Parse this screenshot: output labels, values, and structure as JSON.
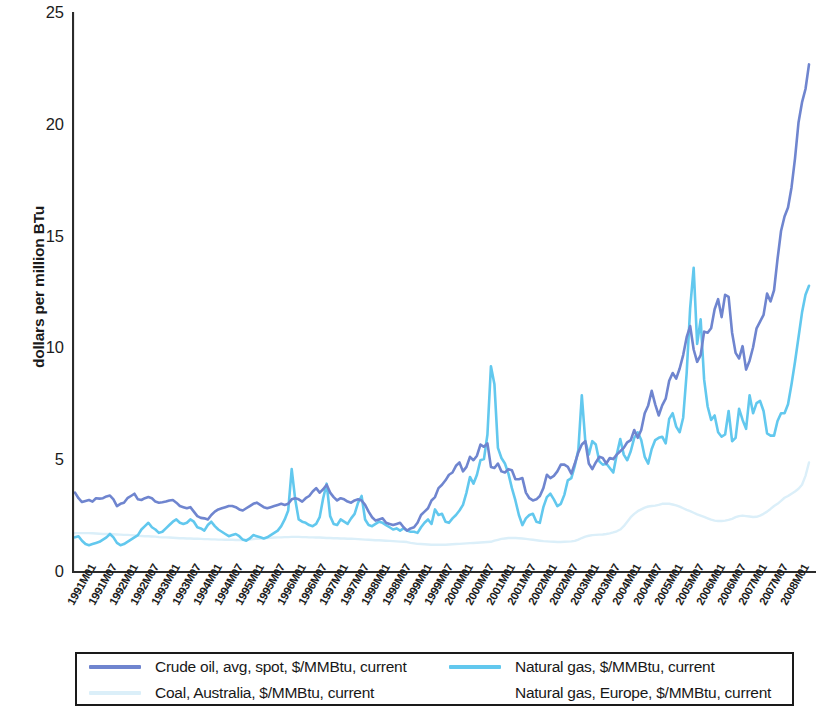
{
  "chart_data": {
    "type": "line",
    "title": "",
    "xlabel": "",
    "ylabel": "dollars per million BTu",
    "ylim": [
      0,
      25
    ],
    "yticks": [
      0,
      5,
      10,
      15,
      20,
      25
    ],
    "grid": false,
    "legend_position": "bottom",
    "x_start": "1991M01",
    "x_end": "2008M01",
    "x_tick_labels": [
      "1991M01",
      "1991M07",
      "1992M01",
      "1992M07",
      "1993M01",
      "1993M07",
      "1994M01",
      "1994M07",
      "1995M01",
      "1995M07",
      "1996M01",
      "1996M07",
      "1997M01",
      "1997M07",
      "1998M01",
      "1998M07",
      "1999M01",
      "1999M07",
      "2000M01",
      "2000M07",
      "2001M01",
      "2001M07",
      "2002M01",
      "2002M07",
      "2003M01",
      "2003M07",
      "2004M01",
      "2004M07",
      "2005M01",
      "2005M07",
      "2006M01",
      "2006M07",
      "2007M01",
      "2007M07",
      "2008M01"
    ],
    "colors": {
      "crude_oil": "#6f85cf",
      "natural_gas": "#62c8ee",
      "coal_australia": "#dbeff9",
      "natural_gas_europe": "#ffffff"
    },
    "series": [
      {
        "name": "Crude oil, avg, spot, $/MMBtu, current",
        "color": "#6f85cf",
        "values": [
          3.55,
          3.3,
          3.13,
          3.18,
          3.22,
          3.15,
          3.3,
          3.28,
          3.3,
          3.38,
          3.42,
          3.25,
          2.95,
          3.05,
          3.1,
          3.3,
          3.4,
          3.5,
          3.25,
          3.22,
          3.3,
          3.35,
          3.3,
          3.15,
          3.1,
          3.12,
          3.15,
          3.2,
          3.22,
          3.1,
          2.95,
          2.9,
          2.85,
          2.9,
          2.7,
          2.5,
          2.42,
          2.4,
          2.35,
          2.55,
          2.7,
          2.8,
          2.85,
          2.9,
          2.95,
          2.95,
          2.9,
          2.8,
          2.75,
          2.85,
          2.95,
          3.05,
          3.1,
          3.0,
          2.9,
          2.85,
          2.9,
          2.95,
          3.0,
          3.05,
          3.0,
          3.05,
          3.25,
          3.3,
          3.25,
          3.15,
          3.3,
          3.4,
          3.6,
          3.75,
          3.55,
          3.7,
          3.9,
          3.55,
          3.35,
          3.2,
          3.3,
          3.25,
          3.15,
          3.1,
          3.2,
          3.25,
          3.2,
          3.0,
          2.7,
          2.45,
          2.3,
          2.35,
          2.4,
          2.2,
          2.15,
          2.1,
          2.15,
          2.2,
          2.0,
          1.85,
          1.95,
          2.0,
          2.2,
          2.55,
          2.7,
          2.85,
          3.2,
          3.35,
          3.75,
          3.9,
          4.1,
          4.35,
          4.45,
          4.75,
          4.9,
          4.5,
          4.7,
          5.15,
          5.0,
          5.2,
          5.7,
          5.6,
          5.75,
          4.7,
          4.65,
          4.85,
          4.5,
          4.45,
          4.6,
          4.55,
          4.15,
          4.15,
          4.2,
          3.55,
          3.3,
          3.2,
          3.25,
          3.4,
          3.75,
          4.35,
          4.2,
          4.3,
          4.5,
          4.8,
          4.8,
          4.7,
          4.4,
          4.85,
          5.35,
          5.7,
          5.85,
          4.85,
          4.6,
          4.9,
          5.15,
          5.1,
          4.85,
          5.1,
          5.05,
          5.25,
          5.4,
          5.55,
          5.8,
          5.9,
          6.35,
          6.0,
          6.35,
          7.1,
          7.45,
          8.1,
          7.5,
          7.0,
          7.45,
          7.75,
          8.55,
          8.9,
          8.65,
          9.1,
          9.7,
          10.5,
          11.0,
          9.95,
          9.4,
          9.7,
          10.75,
          10.7,
          10.9,
          11.75,
          12.2,
          11.4,
          12.4,
          12.3,
          10.7,
          9.8,
          9.55,
          10.1,
          9.05,
          9.45,
          10.05,
          10.9,
          11.2,
          11.5,
          12.45,
          12.1,
          12.6,
          14.0,
          15.25,
          15.9,
          16.3,
          17.2,
          18.5,
          20.1,
          21.0,
          21.6,
          22.7
        ]
      },
      {
        "name": "Natural gas, $/MMBtu, current",
        "color": "#62c8ee",
        "values": [
          1.55,
          1.6,
          1.4,
          1.25,
          1.2,
          1.25,
          1.3,
          1.35,
          1.45,
          1.55,
          1.7,
          1.55,
          1.3,
          1.2,
          1.25,
          1.35,
          1.45,
          1.55,
          1.65,
          1.9,
          2.05,
          2.2,
          2.0,
          1.9,
          1.75,
          1.8,
          1.95,
          2.1,
          2.25,
          2.35,
          2.2,
          2.15,
          2.2,
          2.35,
          2.25,
          2.0,
          1.95,
          1.85,
          2.1,
          2.25,
          2.05,
          1.9,
          1.8,
          1.7,
          1.6,
          1.65,
          1.7,
          1.6,
          1.45,
          1.4,
          1.5,
          1.65,
          1.6,
          1.55,
          1.5,
          1.55,
          1.65,
          1.75,
          1.85,
          2.05,
          2.35,
          2.75,
          4.6,
          3.25,
          2.35,
          2.25,
          2.2,
          2.1,
          2.05,
          2.15,
          2.45,
          3.3,
          3.95,
          2.5,
          2.15,
          2.1,
          2.35,
          2.25,
          2.15,
          2.4,
          2.6,
          3.1,
          3.4,
          2.35,
          2.1,
          2.05,
          2.15,
          2.25,
          2.2,
          2.1,
          2.0,
          1.9,
          1.95,
          1.85,
          1.95,
          1.85,
          1.8,
          1.8,
          1.75,
          2.0,
          2.2,
          2.35,
          2.15,
          2.8,
          2.55,
          2.6,
          2.25,
          2.2,
          2.4,
          2.55,
          2.75,
          3.0,
          3.55,
          4.25,
          3.95,
          4.35,
          5.0,
          5.05,
          6.15,
          9.2,
          8.4,
          5.55,
          5.1,
          4.85,
          4.4,
          3.75,
          3.2,
          2.55,
          2.1,
          2.4,
          2.55,
          2.6,
          2.25,
          2.2,
          2.9,
          3.35,
          3.5,
          3.25,
          2.95,
          3.05,
          3.45,
          4.1,
          4.2,
          4.75,
          5.45,
          7.9,
          5.85,
          5.25,
          5.85,
          5.7,
          4.95,
          4.8,
          4.85,
          4.65,
          4.45,
          5.25,
          5.95,
          5.25,
          5.0,
          5.4,
          6.0,
          6.25,
          5.9,
          5.15,
          4.85,
          5.5,
          5.9,
          6.0,
          6.05,
          5.75,
          6.85,
          7.1,
          6.5,
          6.25,
          6.9,
          8.9,
          11.8,
          13.6,
          10.2,
          11.3,
          8.6,
          7.4,
          6.8,
          7.0,
          6.25,
          6.05,
          6.15,
          7.2,
          5.85,
          6.0,
          7.3,
          6.8,
          6.4,
          7.9,
          7.1,
          7.55,
          7.65,
          7.2,
          6.2,
          6.1,
          6.1,
          6.75,
          7.1,
          7.1,
          7.5,
          8.4,
          9.4,
          10.5,
          11.6,
          12.4,
          12.8
        ]
      },
      {
        "name": "Coal, Australia, $/MMBtu, current",
        "color": "#dbeff9",
        "values": [
          1.74,
          1.74,
          1.74,
          1.74,
          1.74,
          1.73,
          1.72,
          1.71,
          1.7,
          1.7,
          1.7,
          1.69,
          1.68,
          1.67,
          1.66,
          1.66,
          1.65,
          1.64,
          1.62,
          1.61,
          1.6,
          1.6,
          1.59,
          1.58,
          1.56,
          1.55,
          1.55,
          1.54,
          1.53,
          1.52,
          1.51,
          1.51,
          1.5,
          1.5,
          1.49,
          1.49,
          1.48,
          1.47,
          1.47,
          1.46,
          1.46,
          1.45,
          1.45,
          1.44,
          1.44,
          1.44,
          1.43,
          1.43,
          1.43,
          1.44,
          1.45,
          1.47,
          1.49,
          1.5,
          1.51,
          1.52,
          1.53,
          1.54,
          1.55,
          1.55,
          1.56,
          1.56,
          1.57,
          1.57,
          1.57,
          1.56,
          1.56,
          1.55,
          1.55,
          1.54,
          1.54,
          1.53,
          1.52,
          1.52,
          1.51,
          1.51,
          1.5,
          1.5,
          1.49,
          1.49,
          1.48,
          1.47,
          1.46,
          1.45,
          1.44,
          1.43,
          1.42,
          1.42,
          1.41,
          1.4,
          1.39,
          1.38,
          1.37,
          1.36,
          1.35,
          1.34,
          1.3,
          1.28,
          1.26,
          1.25,
          1.24,
          1.23,
          1.22,
          1.22,
          1.22,
          1.22,
          1.22,
          1.23,
          1.24,
          1.25,
          1.26,
          1.27,
          1.28,
          1.29,
          1.3,
          1.31,
          1.32,
          1.33,
          1.34,
          1.35,
          1.4,
          1.44,
          1.48,
          1.5,
          1.52,
          1.52,
          1.52,
          1.51,
          1.5,
          1.48,
          1.46,
          1.44,
          1.42,
          1.4,
          1.38,
          1.37,
          1.36,
          1.35,
          1.34,
          1.34,
          1.35,
          1.36,
          1.37,
          1.39,
          1.45,
          1.52,
          1.58,
          1.62,
          1.65,
          1.66,
          1.67,
          1.68,
          1.7,
          1.73,
          1.77,
          1.82,
          1.9,
          2.05,
          2.25,
          2.45,
          2.6,
          2.72,
          2.8,
          2.88,
          2.93,
          2.95,
          2.97,
          3.0,
          3.05,
          3.06,
          3.05,
          3.02,
          2.98,
          2.92,
          2.85,
          2.78,
          2.72,
          2.65,
          2.58,
          2.52,
          2.46,
          2.4,
          2.34,
          2.3,
          2.28,
          2.28,
          2.3,
          2.33,
          2.38,
          2.45,
          2.5,
          2.52,
          2.5,
          2.48,
          2.46,
          2.47,
          2.52,
          2.6,
          2.7,
          2.82,
          2.95,
          3.05,
          3.18,
          3.32,
          3.4,
          3.5,
          3.6,
          3.72,
          3.9,
          4.3,
          4.9
        ]
      },
      {
        "name": "Natural gas, Europe, $/MMBtu, current",
        "color": "#ffffff",
        "values": []
      }
    ]
  },
  "axis": {
    "y_tick_labels": [
      "25",
      "20",
      "15",
      "10",
      "5",
      "0"
    ]
  },
  "legend": {
    "entries": [
      {
        "label": "Crude oil, avg, spot, $/MMBtu, current",
        "color": "#6f85cf"
      },
      {
        "label": "Natural gas, $/MMBtu, current",
        "color": "#62c8ee"
      },
      {
        "label": "Coal, Australia, $/MMBtu, current",
        "color": "#dbeff9"
      },
      {
        "label": "Natural gas, Europe, $/MMBtu, current",
        "color": "#ffffff"
      }
    ]
  }
}
